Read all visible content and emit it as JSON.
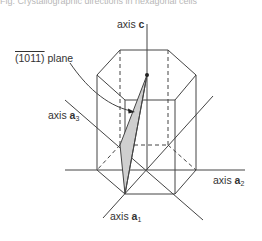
{
  "caption": "Fig. Crystallographic directions in hexagonal cells",
  "labels": {
    "axis_c": {
      "prefix": "axis ",
      "bold": "c",
      "sub": ""
    },
    "axis_a1": {
      "prefix": "axis ",
      "bold": "a",
      "sub": "1"
    },
    "axis_a2": {
      "prefix": "axis ",
      "bold": "a",
      "sub": "2"
    },
    "axis_a3": {
      "prefix": "axis ",
      "bold": "a",
      "sub": "3"
    },
    "plane": {
      "miller": "(1011)",
      "suffix": " plane"
    }
  },
  "colors": {
    "line": "#444444",
    "plane_fill": "#cfcfcf",
    "text": "#333333"
  }
}
